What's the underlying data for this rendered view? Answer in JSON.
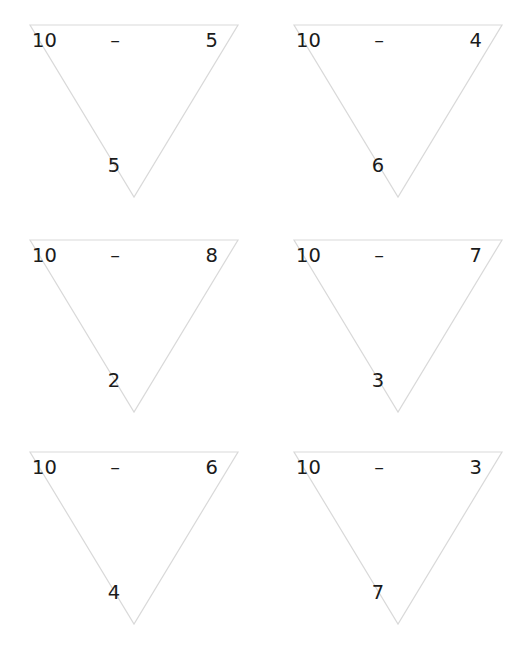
{
  "page": {
    "background_color": "#ffffff",
    "line_color": "#d9d9d9",
    "text_color": "#1b1b1b",
    "layout": {
      "columns": 2,
      "rows": 3
    }
  },
  "problems": [
    {
      "id": "triangle-1",
      "minuend": "10",
      "operator": "–",
      "subtrahend": "5",
      "answer": "5"
    },
    {
      "id": "triangle-2",
      "minuend": "10",
      "operator": "–",
      "subtrahend": "4",
      "answer": "6"
    },
    {
      "id": "triangle-3",
      "minuend": "10",
      "operator": "–",
      "subtrahend": "8",
      "answer": "2"
    },
    {
      "id": "triangle-4",
      "minuend": "10",
      "operator": "–",
      "subtrahend": "7",
      "answer": "3"
    },
    {
      "id": "triangle-5",
      "minuend": "10",
      "operator": "–",
      "subtrahend": "6",
      "answer": "4"
    },
    {
      "id": "triangle-6",
      "minuend": "10",
      "operator": "–",
      "subtrahend": "3",
      "answer": "7"
    }
  ]
}
